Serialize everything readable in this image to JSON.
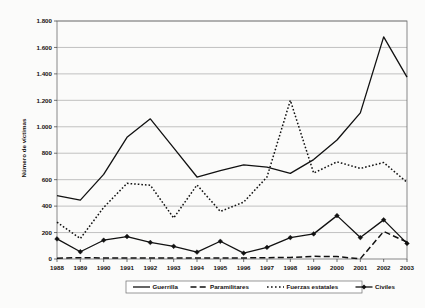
{
  "chart_data": {
    "type": "line",
    "title": "",
    "xlabel": "",
    "ylabel": "Número de víctimas",
    "categories": [
      "1988",
      "1989",
      "1990",
      "1991",
      "1992",
      "1993",
      "1994",
      "1995",
      "1996",
      "1997",
      "1998",
      "1999",
      "2000",
      "2001",
      "2002",
      "2003"
    ],
    "ylim": [
      0,
      1800
    ],
    "ytick_values": [
      0,
      200,
      400,
      600,
      800,
      1000,
      1200,
      1400,
      1600,
      1800
    ],
    "ytick_labels": [
      "0",
      "200",
      "400",
      "600",
      "800",
      "1.000",
      "1.200",
      "1.400",
      "1.600",
      "1.800"
    ],
    "grid": true,
    "legend_position": "bottom",
    "series": [
      {
        "name": "Guerrilla",
        "style": "solid",
        "marker": "none",
        "color": "#111111",
        "values": [
          480,
          445,
          640,
          920,
          1060,
          840,
          620,
          668,
          712,
          695,
          648,
          752,
          900,
          1105,
          1680,
          1375
        ]
      },
      {
        "name": "Paramilitares",
        "style": "dashed",
        "marker": "none",
        "color": "#111111",
        "values": [
          6,
          10,
          8,
          8,
          8,
          8,
          8,
          8,
          8,
          10,
          12,
          20,
          18,
          2,
          208,
          128
        ]
      },
      {
        "name": "Fuerzas estatales",
        "style": "dotted",
        "marker": "none",
        "color": "#111111",
        "values": [
          278,
          155,
          390,
          572,
          558,
          310,
          560,
          360,
          430,
          620,
          1200,
          650,
          735,
          685,
          730,
          580
        ]
      },
      {
        "name": "Civiles",
        "style": "solid",
        "marker": "diamond",
        "color": "#111111",
        "values": [
          152,
          55,
          142,
          170,
          125,
          96,
          52,
          134,
          44,
          88,
          162,
          190,
          328,
          162,
          296,
          118
        ]
      }
    ]
  },
  "axis": {
    "y_title": "Número de víctimas"
  },
  "legend": {
    "items": [
      {
        "label": "Guerrilla",
        "style": "solid"
      },
      {
        "label": "Paramilitares",
        "style": "dashed"
      },
      {
        "label": "Fuerzas estatales",
        "style": "dotted"
      },
      {
        "label": "Civiles",
        "style": "solid-marker"
      }
    ]
  }
}
